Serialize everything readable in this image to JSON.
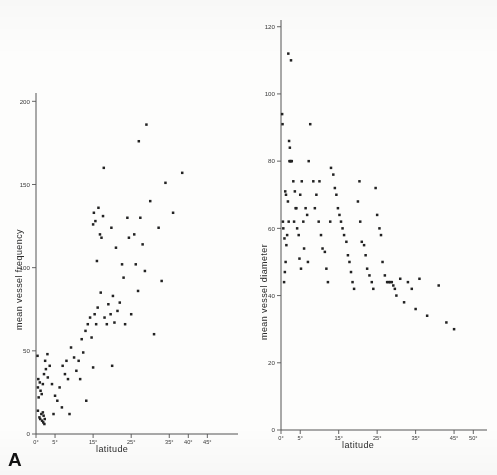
{
  "figure": {
    "panel_a_letter": "A",
    "panel_b_letter": "B"
  },
  "chart_data": [
    {
      "type": "scatter",
      "panel": "A",
      "title": "",
      "xlabel": "latitude",
      "ylabel": "mean vessel frequency",
      "xlim": [
        0,
        52
      ],
      "ylim": [
        0,
        205
      ],
      "grid": false,
      "legend": null,
      "xticks": [
        0,
        5,
        15,
        25,
        35,
        40,
        45
      ],
      "xticklabels": [
        "0°",
        "5°",
        "15°",
        "25°",
        "35°",
        "40°",
        "45°"
      ],
      "yticks": [
        0,
        50,
        100,
        150,
        200
      ],
      "yticklabels": [
        "0",
        "50",
        "100",
        "150",
        "200"
      ],
      "points": [
        [
          0.4,
          47
        ],
        [
          0.6,
          33
        ],
        [
          0.5,
          28
        ],
        [
          0.7,
          22
        ],
        [
          0.5,
          14
        ],
        [
          0.9,
          10
        ],
        [
          1.1,
          9
        ],
        [
          1.4,
          12
        ],
        [
          1.6,
          8
        ],
        [
          1.9,
          7
        ],
        [
          2.0,
          11
        ],
        [
          2.3,
          9
        ],
        [
          1.8,
          13
        ],
        [
          2.2,
          6
        ],
        [
          1.2,
          26
        ],
        [
          1.5,
          24
        ],
        [
          1.0,
          31
        ],
        [
          1.8,
          30
        ],
        [
          2.1,
          36
        ],
        [
          2.6,
          39
        ],
        [
          3.1,
          34
        ],
        [
          2.4,
          44
        ],
        [
          3.6,
          41
        ],
        [
          3.0,
          48
        ],
        [
          4.2,
          30
        ],
        [
          5.0,
          23
        ],
        [
          5.6,
          20
        ],
        [
          6.2,
          28
        ],
        [
          7.0,
          41
        ],
        [
          7.6,
          36
        ],
        [
          8.0,
          44
        ],
        [
          8.4,
          33
        ],
        [
          9.2,
          52
        ],
        [
          10.0,
          46
        ],
        [
          10.6,
          38
        ],
        [
          11.2,
          44
        ],
        [
          12.0,
          57
        ],
        [
          12.4,
          49
        ],
        [
          11.6,
          33
        ],
        [
          13.2,
          20
        ],
        [
          13.0,
          62
        ],
        [
          13.6,
          66
        ],
        [
          14.2,
          70
        ],
        [
          14.6,
          58
        ],
        [
          15.0,
          40
        ],
        [
          15.4,
          72
        ],
        [
          15.8,
          66
        ],
        [
          16.2,
          76
        ],
        [
          16.0,
          104
        ],
        [
          16.4,
          136
        ],
        [
          16.8,
          120
        ],
        [
          15.2,
          133
        ],
        [
          15.6,
          128
        ],
        [
          15.0,
          126
        ],
        [
          17.2,
          118
        ],
        [
          17.6,
          131
        ],
        [
          17.0,
          85
        ],
        [
          18.0,
          70
        ],
        [
          18.6,
          66
        ],
        [
          19.0,
          78
        ],
        [
          19.6,
          72
        ],
        [
          20.2,
          83
        ],
        [
          20.6,
          67
        ],
        [
          21.0,
          112
        ],
        [
          21.4,
          74
        ],
        [
          22.0,
          79
        ],
        [
          22.6,
          102
        ],
        [
          23.0,
          94
        ],
        [
          23.4,
          66
        ],
        [
          24.0,
          130
        ],
        [
          24.4,
          118
        ],
        [
          25.0,
          72
        ],
        [
          25.8,
          120
        ],
        [
          26.2,
          102
        ],
        [
          26.8,
          86
        ],
        [
          27.4,
          130
        ],
        [
          28.0,
          114
        ],
        [
          28.6,
          98
        ],
        [
          29.0,
          186
        ],
        [
          27.0,
          176
        ],
        [
          30.0,
          140
        ],
        [
          31.0,
          60
        ],
        [
          32.2,
          124
        ],
        [
          33.0,
          92
        ],
        [
          34.0,
          151
        ],
        [
          36.0,
          133
        ],
        [
          38.4,
          157
        ],
        [
          19.8,
          124
        ],
        [
          17.8,
          160
        ],
        [
          20.0,
          41
        ],
        [
          6.8,
          16
        ],
        [
          8.8,
          12
        ],
        [
          4.6,
          12
        ]
      ]
    },
    {
      "type": "scatter",
      "panel": "B",
      "title": "",
      "xlabel": "latitude",
      "ylabel": "mean vessel diameter",
      "xlim": [
        0,
        52
      ],
      "ylim": [
        0,
        122
      ],
      "grid": false,
      "legend": null,
      "xticks": [
        0,
        5,
        15,
        25,
        35,
        45,
        50
      ],
      "xticklabels": [
        "0°",
        "5°",
        "15°",
        "25°",
        "35°",
        "45°",
        "50°"
      ],
      "yticks": [
        0,
        20,
        40,
        60,
        80,
        100,
        120
      ],
      "yticklabels": [
        "0",
        "20",
        "40",
        "60",
        "80",
        "100",
        "120"
      ],
      "points": [
        [
          0.3,
          94
        ],
        [
          0.4,
          91
        ],
        [
          0.5,
          62
        ],
        [
          0.6,
          60
        ],
        [
          0.8,
          44
        ],
        [
          1.0,
          47
        ],
        [
          1.2,
          50
        ],
        [
          0.9,
          57
        ],
        [
          1.4,
          55
        ],
        [
          1.6,
          58
        ],
        [
          1.1,
          71
        ],
        [
          1.3,
          70
        ],
        [
          1.8,
          68
        ],
        [
          2.0,
          62
        ],
        [
          2.2,
          80
        ],
        [
          2.4,
          80
        ],
        [
          2.6,
          80
        ],
        [
          2.8,
          80
        ],
        [
          2.1,
          86
        ],
        [
          2.3,
          84
        ],
        [
          1.9,
          112
        ],
        [
          2.6,
          110
        ],
        [
          3.2,
          74
        ],
        [
          3.6,
          71
        ],
        [
          3.8,
          66
        ],
        [
          4.0,
          66
        ],
        [
          4.2,
          60
        ],
        [
          3.4,
          62
        ],
        [
          4.6,
          58
        ],
        [
          5.0,
          70
        ],
        [
          5.4,
          74
        ],
        [
          5.8,
          62
        ],
        [
          6.4,
          66
        ],
        [
          6.8,
          64
        ],
        [
          7.2,
          80
        ],
        [
          7.6,
          91
        ],
        [
          8.4,
          74
        ],
        [
          8.8,
          66
        ],
        [
          9.2,
          70
        ],
        [
          9.8,
          62
        ],
        [
          10.4,
          58
        ],
        [
          10.8,
          54
        ],
        [
          11.4,
          53
        ],
        [
          11.8,
          48
        ],
        [
          12.2,
          44
        ],
        [
          13.0,
          78
        ],
        [
          13.6,
          76
        ],
        [
          14.0,
          72
        ],
        [
          14.4,
          70
        ],
        [
          14.8,
          66
        ],
        [
          15.2,
          64
        ],
        [
          15.6,
          62
        ],
        [
          16.0,
          60
        ],
        [
          16.4,
          58
        ],
        [
          17.0,
          56
        ],
        [
          17.4,
          52
        ],
        [
          17.8,
          50
        ],
        [
          18.2,
          47
        ],
        [
          18.6,
          44
        ],
        [
          19.0,
          42
        ],
        [
          20.0,
          68
        ],
        [
          20.6,
          62
        ],
        [
          21.0,
          56
        ],
        [
          21.6,
          55
        ],
        [
          22.0,
          52
        ],
        [
          22.4,
          48
        ],
        [
          23.0,
          46
        ],
        [
          23.6,
          44
        ],
        [
          24.0,
          42
        ],
        [
          25.0,
          64
        ],
        [
          25.6,
          60
        ],
        [
          26.0,
          58
        ],
        [
          26.4,
          50
        ],
        [
          27.0,
          46
        ],
        [
          27.6,
          44
        ],
        [
          28.0,
          44
        ],
        [
          28.4,
          44
        ],
        [
          28.8,
          44
        ],
        [
          29.2,
          43
        ],
        [
          29.6,
          42
        ],
        [
          30.0,
          40
        ],
        [
          31.0,
          45
        ],
        [
          32.0,
          38
        ],
        [
          33.0,
          44
        ],
        [
          34.0,
          42
        ],
        [
          35.0,
          36
        ],
        [
          36.0,
          45
        ],
        [
          38.0,
          34
        ],
        [
          41.0,
          43
        ],
        [
          43.0,
          32
        ],
        [
          45.0,
          30
        ],
        [
          24.6,
          72
        ],
        [
          20.4,
          74
        ],
        [
          12.8,
          62
        ],
        [
          10.0,
          74
        ],
        [
          6.0,
          54
        ],
        [
          7.0,
          50
        ],
        [
          5.2,
          48
        ],
        [
          4.8,
          51
        ]
      ]
    }
  ]
}
